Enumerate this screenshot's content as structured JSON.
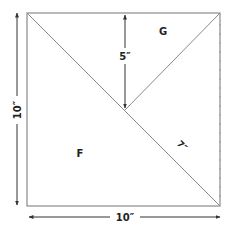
{
  "diagram": {
    "title": "",
    "shapes": {
      "square": {
        "side": "10″"
      },
      "region_g": {
        "label": "G"
      },
      "region_f": {
        "label": "F"
      }
    },
    "dimensions": {
      "left_height": "10″",
      "bottom_width": "10″",
      "g_height": "5″",
      "diagonal_partial": "7″"
    },
    "colors": {
      "line": "#8a8a8a",
      "text": "#222222",
      "arrow": "#333333"
    }
  }
}
